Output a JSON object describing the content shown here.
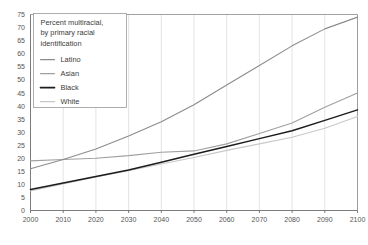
{
  "chart_data": {
    "type": "line",
    "xlabel": "",
    "ylabel": "",
    "xlim": [
      2000,
      2100
    ],
    "ylim": [
      0,
      75
    ],
    "ytick_step": 5,
    "xtick_step": 10,
    "grid": true,
    "legend_position": "top-left",
    "x": [
      2000,
      2010,
      2020,
      2030,
      2040,
      2050,
      2060,
      2070,
      2080,
      2090,
      2100
    ],
    "xticklabels": [
      "2000",
      "2010",
      "2020",
      "2030",
      "2040",
      "2050",
      "2060",
      "2070",
      "2080",
      "2090",
      "2100"
    ],
    "yticklabels": [
      "0",
      "5",
      "10",
      "15",
      "20",
      "25",
      "30",
      "35",
      "40",
      "45",
      "50",
      "55",
      "60",
      "65",
      "70",
      "75"
    ],
    "series": [
      {
        "name": "Latino",
        "color": "#8c8c8c",
        "values": [
          16,
          19.5,
          23.5,
          28.5,
          34,
          40.5,
          48,
          55.5,
          63,
          69.5,
          74
        ]
      },
      {
        "name": "Asian",
        "color": "#a0a0a0",
        "values": [
          19,
          19.5,
          20,
          21,
          22.3,
          22.8,
          25.5,
          29.5,
          33.5,
          39.5,
          45
        ]
      },
      {
        "name": "Black",
        "color": "#1c1c1c",
        "values": [
          8,
          10.5,
          13,
          15.5,
          18.5,
          21.5,
          24.5,
          27.5,
          30.5,
          34.5,
          38.5
        ]
      },
      {
        "name": "White",
        "color": "#c8c8c8",
        "values": [
          7.5,
          10.2,
          12.8,
          15.2,
          17.8,
          20.3,
          23,
          25.5,
          28,
          31.5,
          36
        ]
      }
    ]
  },
  "legend": {
    "title_lines": [
      "Percent multiracial,",
      "by primary racial",
      "identification"
    ],
    "entries": [
      {
        "label": "Latino"
      },
      {
        "label": "Asian"
      },
      {
        "label": "Black"
      },
      {
        "label": "White"
      }
    ]
  }
}
